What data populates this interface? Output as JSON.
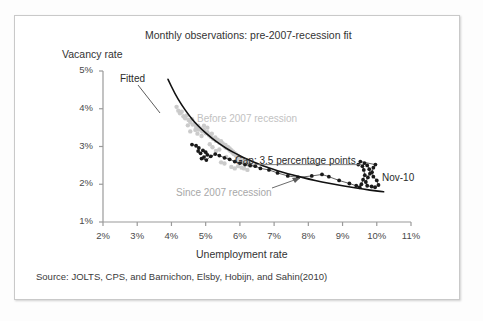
{
  "chart_data": {
    "type": "scatter",
    "title": "Monthly observations: pre-2007-recession fit",
    "xlabel": "Unemployment rate",
    "ylabel": "Vacancy rate",
    "xlim": [
      2,
      11
    ],
    "ylim": [
      1,
      5
    ],
    "xticks": [
      "2%",
      "3%",
      "4%",
      "5%",
      "6%",
      "7%",
      "8%",
      "9%",
      "10%",
      "11%"
    ],
    "xtick_values": [
      2,
      3,
      4,
      5,
      6,
      7,
      8,
      9,
      10,
      11
    ],
    "yticks": [
      "1%",
      "2%",
      "3%",
      "4%",
      "5%"
    ],
    "ytick_values": [
      1,
      2,
      3,
      4,
      5
    ],
    "grid": false,
    "legend_position": "inline-annotations",
    "source": "Source: JOLTS, CPS, and Barnichon, Elsby, Hobijn, and Sahin(2010)",
    "annotations": [
      {
        "name": "fitted",
        "text": "Fitted",
        "x": 3.6,
        "y": 4.7
      },
      {
        "name": "before-2007-recession",
        "text": "Before 2007 recession",
        "x": 5.8,
        "y": 3.65
      },
      {
        "name": "since-2007-recession",
        "text": "Since 2007 recession",
        "x": 5.3,
        "y": 1.7
      },
      {
        "name": "gap",
        "text": "Gap: 3.5 percentage points",
        "x": 6.9,
        "y": 2.78
      },
      {
        "name": "nov-10",
        "text": "Nov-10",
        "x": 10.2,
        "y": 2.35
      }
    ],
    "gap_leader_line": {
      "x_start": 6.45,
      "x_end": 9.55,
      "y": 2.52
    },
    "series": [
      {
        "name": "Before 2007 recession",
        "marker": "circle",
        "color": "#c8c8c8",
        "connected": false,
        "points": [
          [
            4.15,
            4.05
          ],
          [
            4.2,
            3.95
          ],
          [
            4.25,
            3.88
          ],
          [
            4.3,
            3.92
          ],
          [
            4.35,
            3.8
          ],
          [
            4.4,
            3.75
          ],
          [
            4.45,
            3.82
          ],
          [
            4.5,
            3.7
          ],
          [
            4.55,
            3.65
          ],
          [
            4.6,
            3.72
          ],
          [
            4.62,
            3.58
          ],
          [
            4.68,
            3.6
          ],
          [
            4.72,
            3.52
          ],
          [
            4.78,
            3.55
          ],
          [
            4.8,
            3.45
          ],
          [
            4.85,
            3.48
          ],
          [
            4.9,
            3.4
          ],
          [
            4.95,
            3.44
          ],
          [
            5.0,
            3.35
          ],
          [
            5.05,
            3.38
          ],
          [
            5.1,
            3.3
          ],
          [
            5.15,
            3.26
          ],
          [
            5.18,
            3.34
          ],
          [
            5.22,
            3.2
          ],
          [
            5.28,
            3.24
          ],
          [
            5.3,
            3.15
          ],
          [
            5.35,
            3.18
          ],
          [
            5.4,
            3.1
          ],
          [
            5.45,
            3.14
          ],
          [
            5.48,
            3.05
          ],
          [
            5.5,
            3.08
          ],
          [
            5.55,
            3.0
          ],
          [
            5.58,
            3.04
          ],
          [
            5.6,
            2.96
          ],
          [
            5.65,
            2.99
          ],
          [
            5.68,
            2.92
          ],
          [
            5.7,
            2.95
          ],
          [
            5.72,
            2.88
          ],
          [
            5.75,
            2.9
          ],
          [
            5.78,
            2.84
          ],
          [
            5.8,
            2.86
          ],
          [
            5.82,
            2.8
          ],
          [
            5.85,
            2.82
          ],
          [
            5.88,
            2.76
          ],
          [
            5.9,
            2.78
          ],
          [
            5.92,
            2.72
          ],
          [
            5.95,
            2.74
          ],
          [
            5.98,
            2.68
          ],
          [
            6.0,
            2.7
          ],
          [
            6.05,
            2.64
          ],
          [
            6.08,
            2.66
          ],
          [
            6.1,
            2.6
          ],
          [
            6.15,
            2.62
          ],
          [
            6.18,
            2.56
          ],
          [
            6.2,
            2.58
          ],
          [
            6.25,
            2.52
          ],
          [
            6.28,
            2.55
          ],
          [
            6.3,
            2.49
          ],
          [
            6.35,
            2.51
          ],
          [
            6.05,
            2.44
          ],
          [
            5.95,
            2.48
          ],
          [
            5.85,
            2.42
          ],
          [
            5.75,
            2.46
          ],
          [
            5.55,
            2.55
          ],
          [
            5.45,
            2.58
          ],
          [
            4.95,
            3.55
          ],
          [
            5.05,
            3.5
          ],
          [
            4.7,
            3.44
          ],
          [
            4.55,
            3.4
          ],
          [
            5.4,
            2.92
          ],
          [
            5.6,
            2.72
          ],
          [
            5.9,
            2.62
          ],
          [
            6.12,
            2.42
          ],
          [
            6.22,
            2.38
          ],
          [
            5.3,
            2.88
          ],
          [
            5.2,
            2.98
          ],
          [
            5.12,
            3.06
          ],
          [
            4.88,
            3.28
          ],
          [
            4.76,
            3.34
          ],
          [
            4.48,
            3.56
          ]
        ]
      },
      {
        "name": "Since 2007 recession",
        "marker": "filled-circle",
        "color": "#1a1a1a",
        "connected": true,
        "points": [
          [
            4.6,
            3.05
          ],
          [
            4.72,
            3.02
          ],
          [
            4.8,
            2.96
          ],
          [
            4.78,
            2.88
          ],
          [
            4.85,
            2.82
          ],
          [
            4.92,
            2.9
          ],
          [
            5.0,
            2.85
          ],
          [
            5.05,
            2.78
          ],
          [
            4.95,
            2.72
          ],
          [
            4.88,
            2.68
          ],
          [
            5.02,
            2.64
          ],
          [
            5.15,
            2.74
          ],
          [
            5.28,
            2.8
          ],
          [
            5.4,
            2.76
          ],
          [
            5.55,
            2.7
          ],
          [
            5.7,
            2.66
          ],
          [
            5.85,
            2.6
          ],
          [
            6.0,
            2.56
          ],
          [
            6.15,
            2.52
          ],
          [
            6.3,
            2.5
          ],
          [
            6.45,
            2.48
          ],
          [
            6.6,
            2.42
          ],
          [
            6.85,
            2.38
          ],
          [
            7.1,
            2.3
          ],
          [
            7.4,
            2.22
          ],
          [
            7.7,
            2.18
          ],
          [
            8.1,
            2.22
          ],
          [
            8.4,
            2.26
          ],
          [
            8.6,
            2.2
          ],
          [
            8.9,
            2.1
          ],
          [
            9.2,
            2.02
          ],
          [
            9.4,
            1.96
          ],
          [
            9.5,
            1.92
          ],
          [
            9.55,
            2.0
          ],
          [
            9.6,
            2.12
          ],
          [
            9.65,
            2.24
          ],
          [
            9.62,
            2.38
          ],
          [
            9.58,
            2.48
          ],
          [
            9.64,
            2.56
          ],
          [
            9.72,
            2.5
          ],
          [
            9.78,
            2.4
          ],
          [
            9.8,
            2.28
          ],
          [
            9.74,
            2.18
          ],
          [
            9.68,
            2.06
          ],
          [
            9.72,
            1.96
          ],
          [
            9.85,
            1.94
          ],
          [
            9.95,
            1.92
          ],
          [
            10.05,
            1.98
          ],
          [
            10.0,
            2.1
          ],
          [
            9.9,
            2.2
          ],
          [
            9.86,
            2.32
          ],
          [
            9.9,
            2.44
          ],
          [
            9.96,
            2.52
          ],
          [
            9.52,
            2.6
          ],
          [
            9.46,
            2.52
          ]
        ]
      }
    ],
    "fitted_curve": {
      "name": "Fitted",
      "color": "#111111",
      "points": [
        [
          3.9,
          4.78
        ],
        [
          4.1,
          4.4
        ],
        [
          4.3,
          4.1
        ],
        [
          4.5,
          3.84
        ],
        [
          4.7,
          3.62
        ],
        [
          4.9,
          3.44
        ],
        [
          5.1,
          3.28
        ],
        [
          5.3,
          3.14
        ],
        [
          5.5,
          3.01
        ],
        [
          5.7,
          2.9
        ],
        [
          5.9,
          2.8
        ],
        [
          6.1,
          2.71
        ],
        [
          6.3,
          2.63
        ],
        [
          6.5,
          2.55
        ],
        [
          6.8,
          2.45
        ],
        [
          7.1,
          2.36
        ],
        [
          7.4,
          2.28
        ],
        [
          7.7,
          2.21
        ],
        [
          8.0,
          2.14
        ],
        [
          8.4,
          2.06
        ],
        [
          8.8,
          1.99
        ],
        [
          9.2,
          1.93
        ],
        [
          9.6,
          1.87
        ],
        [
          10.0,
          1.82
        ],
        [
          10.2,
          1.8
        ]
      ]
    }
  }
}
